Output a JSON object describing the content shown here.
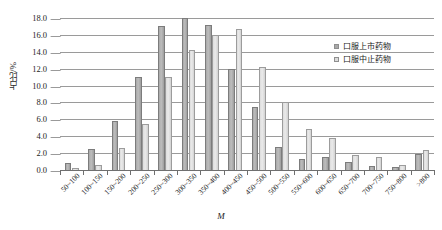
{
  "chart_data": {
    "type": "bar",
    "title": "",
    "subtitle": "",
    "xlabel": "M",
    "ylabel": "占比/%",
    "ylim": [
      0.0,
      18.0
    ],
    "ytick_step": 2.0,
    "grid": true,
    "legend_position": "upper-right-inside",
    "categories": [
      "50~100",
      "100~150",
      "150~200",
      "200~250",
      "250~300",
      "300~350",
      "350~400",
      "400~450",
      "450~500",
      "500~550",
      "550~600",
      "600~650",
      "650~700",
      "700~750",
      "750~800",
      ">800"
    ],
    "ytick_labels": [
      "0.0",
      "2.0",
      "4.0",
      "6.0",
      "8.0",
      "10.0",
      "12.0",
      "14.0",
      "16.0",
      "18.0"
    ],
    "ytick_values": [
      0.0,
      2.0,
      4.0,
      6.0,
      8.0,
      10.0,
      12.0,
      14.0,
      16.0,
      18.0
    ],
    "series": [
      {
        "name": "口服上市药物",
        "color": "#a9a9a9",
        "values": [
          0.8,
          2.5,
          5.8,
          11.0,
          17.0,
          18.0,
          17.2,
          12.0,
          7.5,
          2.7,
          1.3,
          1.5,
          1.0,
          0.5,
          0.4,
          1.9
        ]
      },
      {
        "name": "口服中止药物",
        "color": "#dcdcdc",
        "values": [
          0.2,
          0.6,
          2.6,
          5.5,
          11.0,
          14.2,
          16.0,
          16.7,
          12.2,
          8.0,
          4.8,
          3.8,
          1.8,
          1.5,
          0.6,
          2.4
        ]
      }
    ]
  }
}
